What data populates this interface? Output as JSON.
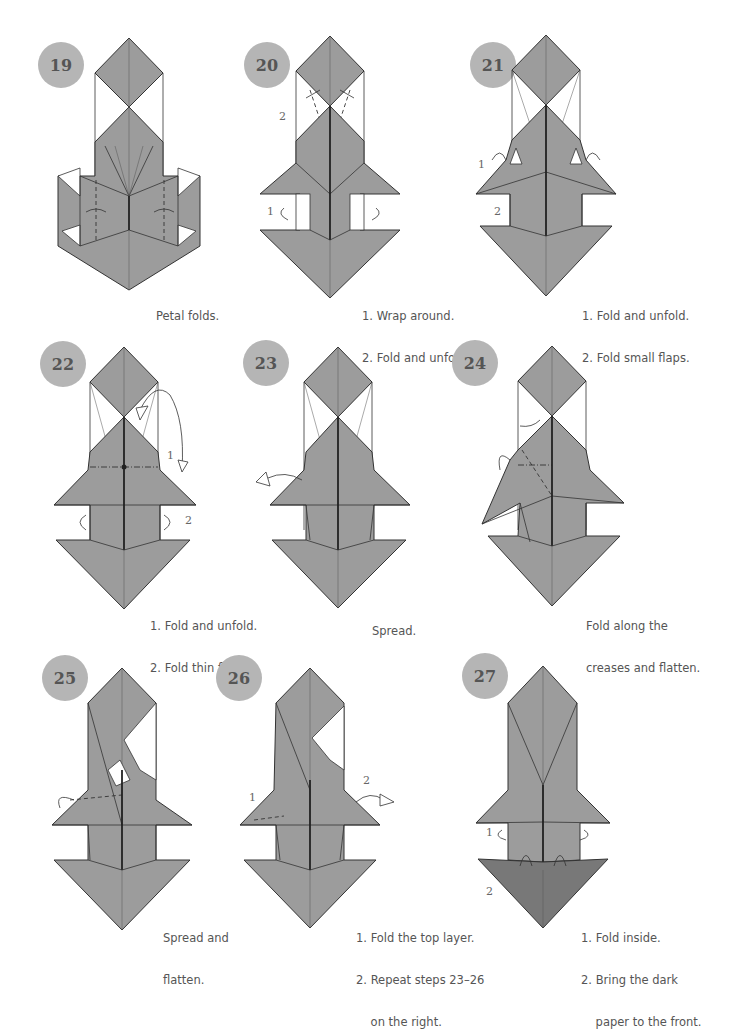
{
  "page": {
    "background": "#ffffff",
    "badge_color": "#b5b5b5",
    "paper_color": "#9c9c9c",
    "dark_paper_color": "#787878"
  },
  "steps": [
    {
      "number": "19",
      "caption": [
        "Petal folds."
      ],
      "labels": []
    },
    {
      "number": "20",
      "caption": [
        "1. Wrap around.",
        "2. Fold and unfold."
      ],
      "labels": [
        "2",
        "1"
      ]
    },
    {
      "number": "21",
      "caption": [
        "1. Fold and unfold.",
        "2. Fold small flaps."
      ],
      "labels": [
        "1",
        "2"
      ]
    },
    {
      "number": "22",
      "caption": [
        "1. Fold and unfold.",
        "2. Fold thin flaps."
      ],
      "labels": [
        "1",
        "2"
      ]
    },
    {
      "number": "23",
      "caption": [
        "Spread."
      ],
      "labels": []
    },
    {
      "number": "24",
      "caption": [
        "Fold along the",
        "creases and flatten."
      ],
      "labels": []
    },
    {
      "number": "25",
      "caption": [
        "Spread and",
        "flatten."
      ],
      "labels": []
    },
    {
      "number": "26",
      "caption": [
        "1. Fold the top layer.",
        "2. Repeat steps 23–26",
        "    on the right."
      ],
      "labels": [
        "1",
        "2"
      ]
    },
    {
      "number": "27",
      "caption": [
        "1. Fold inside.",
        "2. Bring the dark",
        "    paper to the front."
      ],
      "labels": [
        "1",
        "2"
      ]
    }
  ]
}
